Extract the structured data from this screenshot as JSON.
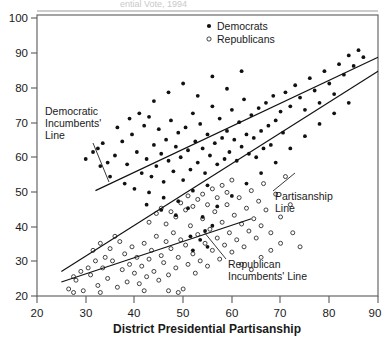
{
  "figure": {
    "ghost_header": "ential Vote, 1994",
    "width": 387,
    "height": 337
  },
  "axes": {
    "x_title": "District Presidential Partisanship",
    "y_title": "",
    "x_ticks": [
      "20",
      "30",
      "40",
      "50",
      "60",
      "70",
      "80",
      "90"
    ],
    "y_ticks": [
      "20",
      "30",
      "40",
      "50",
      "60",
      "70",
      "80",
      "90",
      "100"
    ]
  },
  "legend": {
    "items": [
      {
        "label": "Democrats",
        "marker": "filled-dot",
        "color": "#111111"
      },
      {
        "label": "Republicans",
        "marker": "open-circle",
        "color": "#222222"
      }
    ]
  },
  "annotations": [
    {
      "id": "dem-line-label",
      "lines": [
        "Democratic",
        "Incumbents'",
        "Line"
      ]
    },
    {
      "id": "partisanship-line-label",
      "lines": [
        "Partisanship",
        "Line"
      ]
    },
    {
      "id": "rep-line-label",
      "lines": [
        "Republican",
        "Incumbents' Line"
      ]
    }
  ],
  "chart_data": {
    "type": "scatter",
    "title": "",
    "xlabel": "District Presidential Partisanship",
    "ylabel": "",
    "xlim": [
      20,
      90
    ],
    "ylim": [
      20,
      100
    ],
    "xticks": [
      20,
      30,
      40,
      50,
      60,
      70,
      80,
      90
    ],
    "yticks": [
      20,
      30,
      40,
      50,
      60,
      70,
      80,
      90,
      100
    ],
    "grid": false,
    "legend_position": "top-center-right",
    "series": [
      {
        "name": "Democrats",
        "marker": "filled-dot",
        "color": "#111111",
        "points": [
          [
            32.5,
            62.0
          ],
          [
            33.5,
            63.5
          ],
          [
            34.5,
            58.0
          ],
          [
            36.0,
            60.0
          ],
          [
            37.5,
            64.0
          ],
          [
            38.5,
            57.5
          ],
          [
            39.5,
            66.0
          ],
          [
            40.5,
            61.0
          ],
          [
            41.5,
            55.0
          ],
          [
            42.0,
            68.5
          ],
          [
            42.5,
            59.0
          ],
          [
            43.0,
            71.0
          ],
          [
            43.5,
            54.0
          ],
          [
            44.0,
            63.0
          ],
          [
            44.5,
            57.0
          ],
          [
            45.0,
            67.5
          ],
          [
            45.5,
            60.5
          ],
          [
            46.0,
            52.5
          ],
          [
            46.5,
            64.5
          ],
          [
            47.0,
            58.5
          ],
          [
            47.5,
            70.0
          ],
          [
            48.0,
            55.5
          ],
          [
            48.5,
            62.5
          ],
          [
            49.0,
            66.5
          ],
          [
            49.5,
            59.5
          ],
          [
            50.0,
            53.0
          ],
          [
            50.5,
            68.0
          ],
          [
            51.0,
            61.5
          ],
          [
            51.5,
            56.0
          ],
          [
            52.0,
            72.0
          ],
          [
            52.5,
            64.0
          ],
          [
            53.0,
            58.0
          ],
          [
            53.5,
            69.0
          ],
          [
            54.0,
            62.0
          ],
          [
            54.5,
            55.0
          ],
          [
            55.0,
            66.0
          ],
          [
            55.5,
            60.0
          ],
          [
            56.0,
            74.0
          ],
          [
            56.5,
            63.5
          ],
          [
            57.0,
            57.5
          ],
          [
            57.5,
            70.5
          ],
          [
            58.0,
            65.0
          ],
          [
            58.5,
            59.0
          ],
          [
            59.0,
            67.0
          ],
          [
            59.5,
            61.0
          ],
          [
            60.0,
            73.0
          ],
          [
            60.5,
            64.5
          ],
          [
            61.0,
            58.5
          ],
          [
            61.5,
            69.5
          ],
          [
            62.0,
            62.5
          ],
          [
            62.5,
            76.0
          ],
          [
            63.0,
            66.0
          ],
          [
            63.5,
            60.5
          ],
          [
            64.0,
            71.5
          ],
          [
            64.5,
            65.0
          ],
          [
            65.0,
            59.5
          ],
          [
            65.5,
            73.5
          ],
          [
            66.0,
            67.0
          ],
          [
            66.5,
            62.0
          ],
          [
            67.0,
            75.0
          ],
          [
            67.5,
            68.5
          ],
          [
            68.0,
            63.0
          ],
          [
            68.5,
            77.0
          ],
          [
            69.0,
            70.0
          ],
          [
            70.0,
            72.5
          ],
          [
            70.5,
            66.5
          ],
          [
            71.0,
            78.0
          ],
          [
            72.0,
            74.0
          ],
          [
            73.0,
            80.0
          ],
          [
            74.0,
            76.5
          ],
          [
            75.0,
            73.0
          ],
          [
            76.0,
            82.0
          ],
          [
            77.0,
            78.5
          ],
          [
            78.0,
            75.0
          ],
          [
            79.0,
            84.0
          ],
          [
            80.0,
            80.5
          ],
          [
            81.0,
            77.5
          ],
          [
            82.0,
            86.0
          ],
          [
            83.0,
            83.0
          ],
          [
            84.0,
            88.5
          ],
          [
            85.0,
            85.5
          ],
          [
            86.0,
            90.0
          ],
          [
            87.0,
            88.0
          ],
          [
            41.0,
            72.0
          ],
          [
            44.0,
            75.5
          ],
          [
            47.0,
            78.0
          ],
          [
            50.0,
            80.5
          ],
          [
            53.0,
            77.0
          ],
          [
            56.0,
            82.5
          ],
          [
            59.0,
            79.0
          ],
          [
            62.0,
            84.0
          ],
          [
            35.0,
            54.0
          ],
          [
            38.0,
            52.0
          ],
          [
            40.0,
            50.5
          ],
          [
            43.0,
            49.5
          ],
          [
            46.0,
            48.0
          ],
          [
            49.0,
            47.0
          ],
          [
            52.0,
            50.0
          ],
          [
            55.0,
            51.5
          ],
          [
            30.0,
            59.0
          ],
          [
            31.5,
            61.0
          ],
          [
            33.0,
            57.0
          ],
          [
            36.5,
            68.0
          ],
          [
            39.0,
            70.5
          ],
          [
            42.5,
            46.0
          ],
          [
            45.5,
            44.5
          ],
          [
            48.5,
            43.0
          ],
          [
            51.0,
            45.0
          ],
          [
            54.0,
            42.5
          ],
          [
            57.0,
            45.5
          ],
          [
            60.0,
            48.5
          ],
          [
            63.0,
            52.0
          ],
          [
            66.0,
            55.0
          ],
          [
            69.0,
            58.0
          ],
          [
            72.0,
            62.0
          ],
          [
            75.0,
            65.5
          ],
          [
            78.0,
            69.0
          ],
          [
            81.0,
            72.0
          ],
          [
            84.0,
            75.0
          ],
          [
            53.5,
            36.0
          ],
          [
            54.5,
            38.5
          ],
          [
            55.0,
            34.0
          ],
          [
            56.0,
            40.0
          ],
          [
            52.0,
            33.0
          ],
          [
            51.5,
            37.0
          ]
        ]
      },
      {
        "name": "Republicans",
        "marker": "open-circle",
        "color": "#222222",
        "points": [
          [
            26.5,
            22.0
          ],
          [
            28.0,
            24.5
          ],
          [
            29.5,
            21.5
          ],
          [
            31.0,
            26.0
          ],
          [
            32.5,
            23.0
          ],
          [
            33.5,
            28.0
          ],
          [
            34.5,
            25.0
          ],
          [
            35.5,
            30.0
          ],
          [
            36.5,
            22.5
          ],
          [
            37.5,
            27.5
          ],
          [
            38.0,
            32.0
          ],
          [
            38.5,
            24.0
          ],
          [
            39.0,
            29.0
          ],
          [
            39.5,
            34.0
          ],
          [
            40.0,
            26.5
          ],
          [
            40.5,
            31.0
          ],
          [
            41.0,
            23.5
          ],
          [
            41.5,
            28.5
          ],
          [
            42.0,
            35.0
          ],
          [
            42.5,
            25.5
          ],
          [
            43.0,
            30.5
          ],
          [
            43.5,
            33.0
          ],
          [
            44.0,
            27.0
          ],
          [
            44.5,
            37.0
          ],
          [
            45.0,
            24.5
          ],
          [
            45.5,
            31.5
          ],
          [
            46.0,
            29.5
          ],
          [
            46.5,
            35.5
          ],
          [
            47.0,
            26.0
          ],
          [
            47.5,
            33.5
          ],
          [
            48.0,
            38.0
          ],
          [
            48.5,
            28.0
          ],
          [
            49.0,
            31.0
          ],
          [
            49.5,
            36.0
          ],
          [
            50.0,
            22.0
          ],
          [
            50.5,
            34.5
          ],
          [
            51.0,
            29.0
          ],
          [
            51.5,
            40.0
          ],
          [
            52.0,
            32.0
          ],
          [
            52.5,
            26.5
          ],
          [
            53.0,
            37.5
          ],
          [
            53.5,
            30.0
          ],
          [
            54.0,
            42.0
          ],
          [
            54.5,
            35.0
          ],
          [
            55.0,
            28.5
          ],
          [
            55.5,
            39.0
          ],
          [
            56.0,
            33.0
          ],
          [
            56.5,
            44.0
          ],
          [
            57.0,
            36.5
          ],
          [
            57.5,
            30.5
          ],
          [
            58.0,
            41.0
          ],
          [
            58.5,
            34.5
          ],
          [
            59.0,
            46.0
          ],
          [
            59.5,
            38.0
          ],
          [
            60.0,
            32.5
          ],
          [
            60.5,
            43.0
          ],
          [
            61.0,
            36.0
          ],
          [
            61.5,
            48.0
          ],
          [
            62.0,
            40.5
          ],
          [
            62.5,
            34.0
          ],
          [
            63.0,
            45.0
          ],
          [
            63.5,
            38.5
          ],
          [
            64.0,
            50.0
          ],
          [
            64.5,
            42.0
          ],
          [
            65.0,
            36.5
          ],
          [
            65.5,
            47.0
          ],
          [
            66.0,
            40.0
          ],
          [
            66.5,
            52.0
          ],
          [
            67.0,
            44.5
          ],
          [
            68.0,
            38.0
          ],
          [
            69.0,
            49.0
          ],
          [
            70.0,
            42.5
          ],
          [
            71.0,
            54.0
          ],
          [
            72.0,
            46.0
          ],
          [
            43.0,
            41.0
          ],
          [
            44.5,
            43.5
          ],
          [
            45.5,
            45.0
          ],
          [
            46.5,
            40.5
          ],
          [
            47.5,
            44.0
          ],
          [
            48.5,
            42.5
          ],
          [
            49.5,
            46.5
          ],
          [
            50.5,
            44.5
          ],
          [
            51.0,
            48.5
          ],
          [
            52.0,
            45.5
          ],
          [
            53.0,
            47.5
          ],
          [
            54.0,
            49.0
          ],
          [
            55.0,
            46.0
          ],
          [
            56.0,
            50.5
          ],
          [
            57.0,
            48.0
          ],
          [
            58.0,
            51.5
          ],
          [
            59.0,
            49.5
          ],
          [
            60.0,
            53.0
          ],
          [
            36.0,
            37.0
          ],
          [
            37.0,
            35.5
          ],
          [
            35.0,
            33.5
          ],
          [
            34.0,
            31.0
          ],
          [
            33.0,
            35.0
          ],
          [
            32.0,
            30.0
          ],
          [
            31.5,
            33.0
          ],
          [
            30.5,
            28.0
          ],
          [
            29.0,
            27.0
          ],
          [
            27.5,
            25.5
          ],
          [
            47.0,
            21.5
          ],
          [
            49.0,
            21.0
          ],
          [
            33.0,
            21.0
          ],
          [
            27.5,
            21.0
          ],
          [
            42.0,
            21.5
          ],
          [
            62.0,
            29.0
          ],
          [
            64.0,
            27.5
          ],
          [
            66.0,
            31.0
          ],
          [
            68.0,
            33.0
          ],
          [
            70.0,
            35.0
          ],
          [
            72.5,
            38.0
          ],
          [
            74.0,
            34.0
          ]
        ]
      }
    ],
    "fit_lines": [
      {
        "name": "Democratic Incumbents' Line",
        "x0": 32.0,
        "y0": 50.0,
        "x1": 90.0,
        "y1": 88.0
      },
      {
        "name": "Partisanship Line",
        "x0": 25.0,
        "y0": 27.0,
        "x1": 90.0,
        "y1": 84.0
      },
      {
        "name": "Republican Incumbents' Line",
        "x0": 25.0,
        "y0": 24.0,
        "x1": 64.0,
        "y1": 42.0
      }
    ]
  }
}
